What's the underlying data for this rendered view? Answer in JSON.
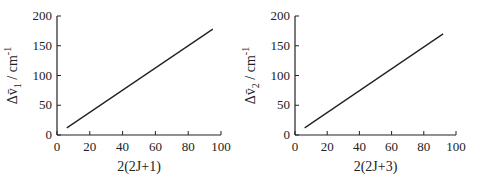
{
  "chart_data": [
    {
      "type": "line",
      "title": "",
      "xlabel": "2(2J+1)",
      "ylabel": "Δṽ₁ / cm⁻¹",
      "xlim": [
        0,
        100
      ],
      "ylim": [
        0,
        200
      ],
      "xticks": [
        0,
        20,
        40,
        60,
        80,
        100
      ],
      "yticks": [
        0,
        50,
        100,
        150,
        200
      ],
      "grid": false,
      "series": [
        {
          "name": "Δṽ1",
          "x": [
            6,
            95
          ],
          "y": [
            12,
            178
          ]
        }
      ]
    },
    {
      "type": "line",
      "title": "",
      "xlabel": "2(2J+3)",
      "ylabel": "Δṽ₂ / cm⁻¹",
      "xlim": [
        0,
        100
      ],
      "ylim": [
        0,
        200
      ],
      "xticks": [
        0,
        20,
        40,
        60,
        80,
        100
      ],
      "yticks": [
        0,
        50,
        100,
        150,
        200
      ],
      "grid": false,
      "series": [
        {
          "name": "Δṽ2",
          "x": [
            6,
            92
          ],
          "y": [
            12,
            170
          ]
        }
      ]
    }
  ],
  "labels": {
    "left_x": "2(2J+1)",
    "left_y_main": "Δv̄",
    "left_y_sub": "1",
    "left_y_unit": " / cm",
    "right_x": "2(2J+3)",
    "right_y_main": "Δv̄",
    "right_y_sub": "2",
    "right_y_unit": " / cm",
    "unit_exp": "-1"
  }
}
